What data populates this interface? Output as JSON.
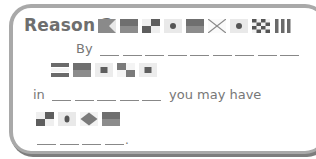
{
  "card": {
    "title": "Reason 2",
    "title_flags": [
      "pennant-notched-flag",
      "solid-band-flag",
      "checkered-quad-flag",
      "dot-flag",
      "solid-band-flag",
      "x-cross-flag",
      "dot-flag",
      "checkerboard-flag",
      "vertical-stripes-flag"
    ],
    "line1": {
      "label": "By",
      "blank_count": 9
    },
    "row2_flags": [
      "horizontal-stripes-flag",
      "solid-band-flag",
      "square-center-flag",
      "checkered-quad-flag",
      "square-center-flag"
    ],
    "line3": {
      "prefix": "in",
      "blank_count": 5,
      "suffix": "you may have"
    },
    "row4_flags": [
      "checkered-quad-flag",
      "dot-flag",
      "diamond-flag",
      "solid-band-flag"
    ],
    "line5": {
      "blank_count": 4,
      "end": "."
    }
  },
  "colors": {
    "border": "#a9a9a9",
    "shadow": "#7d7d7d",
    "text": "#6e6e6e",
    "flag_dark": "#6a6a6a",
    "flag_mid": "#8f8f8f",
    "flag_light": "#e6e6e6"
  }
}
